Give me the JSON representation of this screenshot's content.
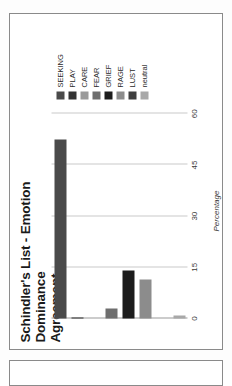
{
  "document": {
    "panel_label": "chart-page-panel",
    "next_panel_label": "next-page-panel"
  },
  "chart_data": {
    "type": "bar",
    "orientation": "horizontal",
    "title": "Schindler's List - Emotion Dominance Agreement",
    "title_line1": "Schindler's List - Emotion Dominance",
    "title_line2": "Agreement",
    "xlabel": "Percentage",
    "ylabel": "",
    "categories": [
      "SEEKING",
      "PLAY",
      "CARE",
      "FEAR",
      "GRIEF",
      "RAGE",
      "LUST",
      "neutral"
    ],
    "values": [
      52.5,
      0.4,
      0.0,
      2.8,
      14.0,
      11.5,
      0.0,
      1.0
    ],
    "ticks": [
      0,
      15,
      30,
      45,
      60
    ],
    "tick_labels": [
      "0",
      "15",
      "30",
      "45",
      "60"
    ],
    "xlim": [
      0,
      63
    ],
    "grid": true,
    "legend_position": "right",
    "colors": [
      "#4a4a4a",
      "#333333",
      "#9a9a9a",
      "#6e6e6e",
      "#1c1c1c",
      "#8c8c8c",
      "#3f3f3f",
      "#a8a8a8"
    ],
    "grid_color": "#c9c9c9",
    "axis_color": "#9a9a9a"
  },
  "legend": {
    "items": [
      {
        "label": "SEEKING",
        "color": "#4a4a4a"
      },
      {
        "label": "PLAY",
        "color": "#333333"
      },
      {
        "label": "CARE",
        "color": "#9a9a9a"
      },
      {
        "label": "FEAR",
        "color": "#6e6e6e"
      },
      {
        "label": "GRIEF",
        "color": "#1c1c1c"
      },
      {
        "label": "RAGE",
        "color": "#8c8c8c"
      },
      {
        "label": "LUST",
        "color": "#3f3f3f"
      },
      {
        "label": "neutral",
        "color": "#a8a8a8"
      }
    ]
  }
}
